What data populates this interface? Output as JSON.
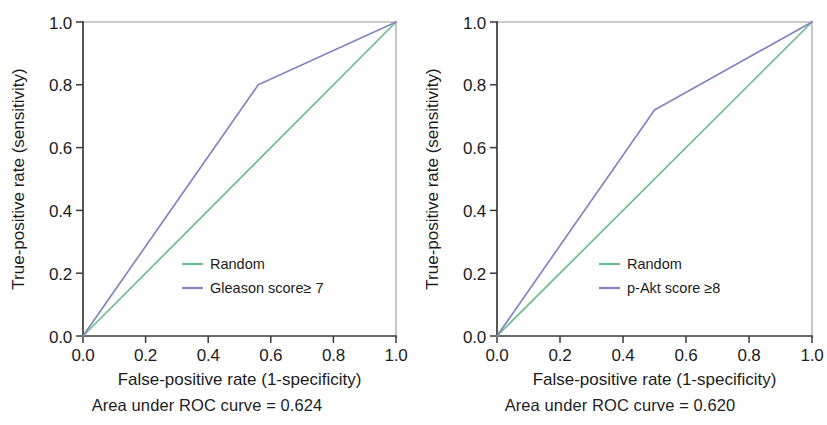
{
  "figure": {
    "panel_count": 2
  },
  "chart_data": [
    {
      "type": "line",
      "title": "",
      "xlabel": "False-positive rate (1-specificity)",
      "ylabel": "True-positive rate (sensitivity)",
      "xlim": [
        0.0,
        1.0
      ],
      "ylim": [
        0.0,
        1.0
      ],
      "xticks": [
        "0.0",
        "0.2",
        "0.4",
        "0.6",
        "0.8",
        "1.0"
      ],
      "yticks": [
        "0.0",
        "0.2",
        "0.4",
        "0.6",
        "0.8",
        "1.0"
      ],
      "xtick_values": [
        0.0,
        0.2,
        0.4,
        0.6,
        0.8,
        1.0
      ],
      "ytick_values": [
        0.0,
        0.2,
        0.4,
        0.6,
        0.8,
        1.0
      ],
      "grid": false,
      "legend_position": "center",
      "series": [
        {
          "name": "Random",
          "color": "#6DBE8E",
          "x": [
            0.0,
            1.0
          ],
          "y": [
            0.0,
            1.0
          ]
        },
        {
          "name": "Gleason score≥ 7",
          "color": "#8186C2",
          "x": [
            0.0,
            0.56,
            1.0
          ],
          "y": [
            0.0,
            0.8,
            1.0
          ]
        }
      ],
      "annotation": "Area under ROC curve = 0.624",
      "auc": 0.624
    },
    {
      "type": "line",
      "title": "",
      "xlabel": "False-positive rate (1-specificity)",
      "ylabel": "True-positive rate (sensitivity)",
      "xlim": [
        0.0,
        1.0
      ],
      "ylim": [
        0.0,
        1.0
      ],
      "xticks": [
        "0.0",
        "0.2",
        "0.4",
        "0.6",
        "0.8",
        "1.0"
      ],
      "yticks": [
        "0.0",
        "0.2",
        "0.4",
        "0.6",
        "0.8",
        "1.0"
      ],
      "xtick_values": [
        0.0,
        0.2,
        0.4,
        0.6,
        0.8,
        1.0
      ],
      "ytick_values": [
        0.0,
        0.2,
        0.4,
        0.6,
        0.8,
        1.0
      ],
      "grid": false,
      "legend_position": "center",
      "series": [
        {
          "name": "Random",
          "color": "#6DBE8E",
          "x": [
            0.0,
            1.0
          ],
          "y": [
            0.0,
            1.0
          ]
        },
        {
          "name": "p-Akt score ≥8",
          "color": "#8186C2",
          "x": [
            0.0,
            0.5,
            1.0
          ],
          "y": [
            0.0,
            0.72,
            1.0
          ]
        }
      ],
      "annotation": "Area under ROC curve = 0.620",
      "auc": 0.62
    }
  ],
  "panels": [
    {
      "caption": "Area under ROC curve = 0.624",
      "xlabel": "False-positive rate (1-specificity)",
      "ylabel": "True-positive rate (sensitivity)",
      "legend": [
        {
          "label": "Random",
          "color": "#6DBE8E"
        },
        {
          "label": "Gleason score≥ 7",
          "color": "#8186C2"
        }
      ]
    },
    {
      "caption": "Area under ROC curve = 0.620",
      "xlabel": "False-positive rate (1-specificity)",
      "ylabel": "True-positive rate (sensitivity)",
      "legend": [
        {
          "label": "Random",
          "color": "#6DBE8E"
        },
        {
          "label": "p-Akt score ≥8",
          "color": "#8186C2"
        }
      ]
    }
  ],
  "colors": {
    "random_line": "#6DBE8E",
    "model_line": "#8186C2",
    "axis": "#3a3a3a",
    "frame": "#9a9a9a",
    "text": "#1c1c1c",
    "background": "#ffffff"
  }
}
